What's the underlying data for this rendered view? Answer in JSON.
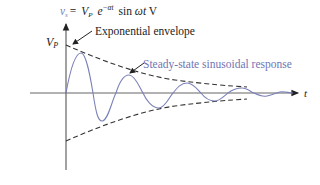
{
  "diagram": {
    "equation": {
      "lhs_symbol": "v",
      "lhs_subscript": "s",
      "equals": "=",
      "vp": "V",
      "vp_sub": "P",
      "exp_base": "e",
      "exp_power": "−αt",
      "sin": "sin",
      "omega_t": "ωt",
      "unit": "V"
    },
    "y_axis_label": "V",
    "y_axis_label_sub": "P",
    "x_axis_label": "t",
    "annotations": {
      "envelope": "Exponential envelope",
      "response": "Steady-state sinusoidal response"
    },
    "colors": {
      "axis": "#555555",
      "envelope": "#333333",
      "response": "#7a80b8",
      "text": "#222222",
      "response_text": "#6f75b3"
    }
  }
}
